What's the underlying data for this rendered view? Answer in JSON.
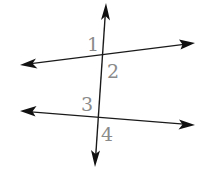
{
  "diagram": {
    "type": "parallel-lines-cut-by-transversal",
    "colors": {
      "line": "#1a1a1a",
      "arrowhead": "#111111",
      "label": "#8a8a8a",
      "background": "#ffffff"
    },
    "lines": [
      {
        "id": "transversal",
        "x1": 106,
        "y1": 3,
        "x2": 95,
        "y2": 167
      },
      {
        "id": "upper-line",
        "x1": 20,
        "y1": 65,
        "x2": 195,
        "y2": 43
      },
      {
        "id": "lower-line",
        "x1": 20,
        "y1": 111,
        "x2": 195,
        "y2": 125
      }
    ],
    "angles": [
      {
        "id": "angle-1",
        "label": "1",
        "x": 87,
        "y": 51
      },
      {
        "id": "angle-2",
        "label": "2",
        "x": 107,
        "y": 78
      },
      {
        "id": "angle-3",
        "label": "3",
        "x": 81,
        "y": 111
      },
      {
        "id": "angle-4",
        "label": "4",
        "x": 101,
        "y": 141
      }
    ]
  }
}
